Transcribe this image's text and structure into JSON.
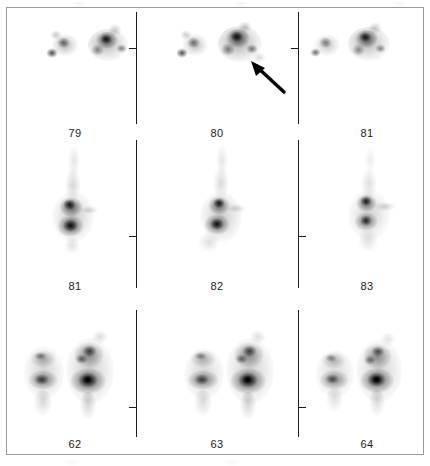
{
  "figure": {
    "modality": "planar-scintigraphy-panel",
    "border_color": "#9a9a9a",
    "divider_color": "#1c1c1c",
    "label_color": "#1c1c1c",
    "background_color": "#ffffff",
    "uptake_color": "#000000",
    "rows": [
      {
        "row_index": 0,
        "view": "oblique",
        "cells": [
          {
            "label": "79",
            "column": 0
          },
          {
            "label": "80",
            "column": 1
          },
          {
            "label": "81",
            "column": 2
          }
        ]
      },
      {
        "row_index": 1,
        "view": "lateral",
        "cells": [
          {
            "label": "81",
            "column": 0
          },
          {
            "label": "82",
            "column": 1
          },
          {
            "label": "83",
            "column": 2
          }
        ]
      },
      {
        "row_index": 2,
        "view": "anterior",
        "cells": [
          {
            "label": "62",
            "column": 0
          },
          {
            "label": "63",
            "column": 1
          },
          {
            "label": "64",
            "column": 2
          }
        ]
      }
    ],
    "annotations": [
      {
        "type": "arrow",
        "name": "lesion-pointer-arrow",
        "row_index": 0,
        "column": 1,
        "direction": "up-left",
        "color": "#000000"
      }
    ]
  }
}
